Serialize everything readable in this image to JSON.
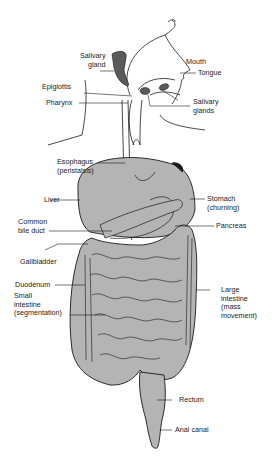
{
  "header": {
    "text": "ucus —"
  },
  "diagram": {
    "organ_fill": "#b4b4b4",
    "dark_fill": "#5a5a5a",
    "line_color": "#1a1a1a",
    "labels": {
      "salivary_gland": "Salivary\ngland",
      "mouth": "Mouth",
      "tongue": "Tongue",
      "epiglottis": "Epiglottis",
      "pharynx": "Pharynx",
      "salivary_glands": "Salivary\nglands",
      "esophagus": "Esophagus\n(peristalsis)",
      "liver": "Liver",
      "stomach": "Stomach\n(churning)",
      "common_bile_duct": "Common\nbile duct",
      "pancreas": "Pancreas",
      "gallbladder": "Gallbladder",
      "duodenum": "Duodenum",
      "small_intestine": "Small\nintestine\n(segmentation)",
      "large_intestine": "Large\nintestine\n(mass\nmovement)",
      "rectum": "Rectum",
      "anal_canal": "Anal canal"
    }
  }
}
